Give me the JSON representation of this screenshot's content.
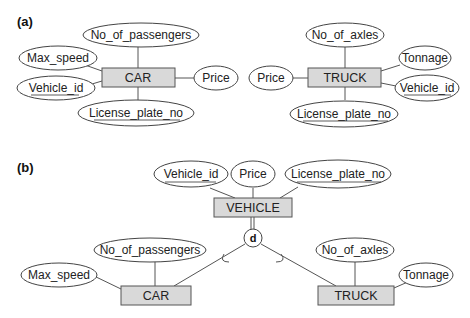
{
  "part_a": {
    "label": "(a)",
    "car": {
      "entity": "CAR",
      "attributes": [
        "No_of_passengers",
        "Max_speed",
        "Vehicle_id",
        "License_plate_no",
        "Price"
      ],
      "key_attributes": [
        "Vehicle_id",
        "License_plate_no"
      ]
    },
    "truck": {
      "entity": "TRUCK",
      "attributes": [
        "No_of_axles",
        "Tonnage",
        "Price",
        "Vehicle_id",
        "License_plate_no"
      ],
      "key_attributes": [
        "Vehicle_id",
        "License_plate_no"
      ]
    }
  },
  "part_b": {
    "label": "(b)",
    "superclass": {
      "entity": "VEHICLE",
      "attributes": [
        "Vehicle_id",
        "Price",
        "License_plate_no"
      ],
      "key_attributes": [
        "Vehicle_id",
        "License_plate_no"
      ]
    },
    "specialization": {
      "symbol": "d",
      "type": "disjoint",
      "participation": "total"
    },
    "subclasses": [
      {
        "entity": "CAR",
        "attributes": [
          "No_of_passengers",
          "Max_speed"
        ]
      },
      {
        "entity": "TRUCK",
        "attributes": [
          "No_of_axles",
          "Tonnage"
        ]
      }
    ]
  }
}
